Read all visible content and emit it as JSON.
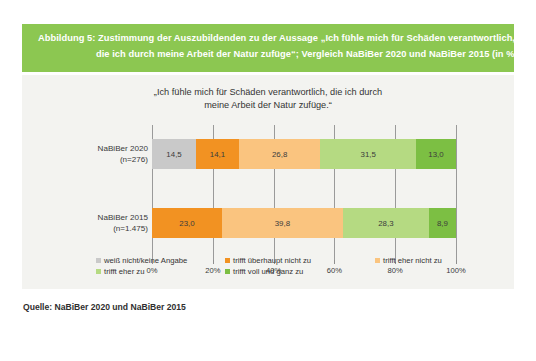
{
  "banner": {
    "line1": "Abbildung 5: Zustimmung der Auszubildenden zu der Aussage „Ich fühle mich für Schäden verantwortlich,",
    "line2": "die ich durch meine Arbeit der Natur zufüge“; Vergleich NaBiBer 2020 und NaBiBer 2015 (in %)",
    "background_color": "#8cc751",
    "text_color": "#ffffff"
  },
  "source": {
    "prefix": "Quelle: ",
    "text": "NaBiBer 2020 und NaBiBer 2015"
  },
  "panel": {
    "background_color": "#f3f3f0"
  },
  "chart_data": {
    "type": "bar",
    "orientation": "horizontal",
    "stacked": true,
    "stacked_percent": true,
    "title": "„Ich fühle mich für Schäden verantwortlich, die ich durch meine Arbeit der Natur zufüge.“",
    "title_line1": "„Ich fühle mich für Schäden verantwortlich, die ich durch",
    "title_line2": "meine Arbeit der Natur zufüge.“",
    "xlabel": "",
    "ylabel": "",
    "xlim": [
      0,
      100
    ],
    "xticks": [
      0,
      20,
      40,
      60,
      80,
      100
    ],
    "xtick_labels": [
      "0%",
      "20%",
      "40%",
      "60%",
      "80%",
      "100%"
    ],
    "grid": true,
    "legend_position": "bottom",
    "categories": [
      "NaBiBer 2020 (n=276)",
      "NaBiBer 2015 (n=1.475)"
    ],
    "category_labels": [
      {
        "line1": "NaBiBer 2020",
        "line2": "(n=276)"
      },
      {
        "line1": "NaBiBer 2015",
        "line2": "(n=1.475)"
      }
    ],
    "series": [
      {
        "name": "weiß nicht/keine Angabe",
        "color": "#c9c9c9",
        "values": [
          14.5,
          0
        ]
      },
      {
        "name": "trifft überhaupt nicht zu",
        "color": "#f29222",
        "values": [
          14.1,
          23.0
        ]
      },
      {
        "name": "trifft eher nicht zu",
        "color": "#fac47f",
        "values": [
          26.8,
          39.8
        ]
      },
      {
        "name": "trifft eher zu",
        "color": "#b5da82",
        "values": [
          31.5,
          28.3
        ]
      },
      {
        "name": "trifft voll und ganz zu",
        "color": "#7cbf43",
        "values": [
          13.0,
          8.9
        ]
      }
    ],
    "data_labels": [
      [
        "14,5",
        "14,1",
        "26,8",
        "31,5",
        "13,0"
      ],
      [
        "",
        "23,0",
        "39,8",
        "28,3",
        "8,9"
      ]
    ],
    "legend_entries": [
      {
        "label": "weiß nicht/keine Angabe",
        "color": "#c9c9c9"
      },
      {
        "label": "trifft überhaupt nicht zu",
        "color": "#f29222"
      },
      {
        "label": "trifft eher nicht zu",
        "color": "#fac47f"
      },
      {
        "label": "trifft eher zu",
        "color": "#b5da82"
      },
      {
        "label": "trifft voll und ganz zu",
        "color": "#7cbf43"
      }
    ]
  }
}
